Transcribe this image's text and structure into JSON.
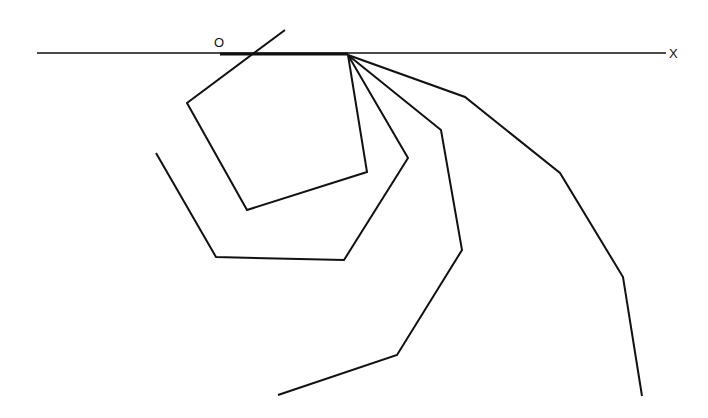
{
  "diagram": {
    "title": "",
    "labels": {
      "origin": "O",
      "x_axis": "X"
    },
    "stroke_color": "#111111",
    "background": "#ffffff",
    "axis": {
      "x1": 37,
      "y1": 53,
      "x2": 666,
      "y2": 53
    },
    "base_segment": {
      "x1": 220,
      "y1": 54,
      "x2": 348,
      "y2": 54
    },
    "pivot": {
      "x": 348,
      "y": 55
    },
    "paths": [
      {
        "name": "pentagon",
        "points": "348,55 367,172 247,210 187,103 285,30"
      },
      {
        "name": "hexagon",
        "points": "348,55 408,158 344,260 216,257 156,153"
      },
      {
        "name": "heptagon",
        "points": "348,55 441,130 462,250 397,355 278,395"
      },
      {
        "name": "octagon",
        "points": "348,55 465,97 560,173 623,277 642,396"
      }
    ]
  }
}
